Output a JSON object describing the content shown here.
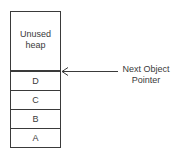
{
  "diagram": {
    "type": "heap-allocation",
    "stack": {
      "unused_label": "Unused heap",
      "objects": [
        {
          "label": "D"
        },
        {
          "label": "C"
        },
        {
          "label": "B"
        },
        {
          "label": "A"
        }
      ]
    },
    "pointer": {
      "label_line1": "Next Object",
      "label_line2": "Pointer",
      "points_to": "boundary between Unused heap and D"
    },
    "colors": {
      "line": "#3a3a3a",
      "text": "#3a3a3a",
      "background": "#ffffff"
    }
  }
}
